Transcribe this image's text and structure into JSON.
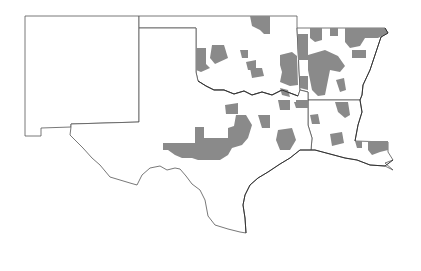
{
  "map": {
    "type": "choropleth",
    "region": "South-Central United States",
    "states": [
      "New Mexico",
      "Texas",
      "Oklahoma",
      "Arkansas",
      "Louisiana"
    ],
    "colors": {
      "background": "#ffffff",
      "state_fill": "#ffffff",
      "state_outline": "#555555",
      "highlight_fill": "#8a8a8a"
    },
    "legend": null,
    "highlighted_areas": [
      {
        "state": "Oklahoma",
        "areas": [
          "northeast panhandle edge",
          "north-central",
          "central",
          "east-central"
        ]
      },
      {
        "state": "Arkansas",
        "areas": [
          "northwest",
          "north",
          "west-central",
          "central-south"
        ]
      },
      {
        "state": "Texas",
        "areas": [
          "west-central block",
          "north-central",
          "northeast",
          "east-central"
        ]
      },
      {
        "state": "Louisiana",
        "areas": [
          "northwest",
          "north-central",
          "central",
          "southeast"
        ]
      }
    ]
  }
}
